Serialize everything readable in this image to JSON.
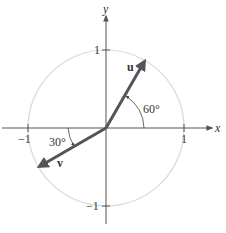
{
  "diagram": {
    "type": "unit-circle-vectors",
    "axes": {
      "x_label": "x",
      "y_label": "y",
      "x_ticks": [
        {
          "value": -1,
          "label": "−1"
        },
        {
          "value": 1,
          "label": "1"
        }
      ],
      "y_ticks": [
        {
          "value": 1,
          "label": "1"
        },
        {
          "value": -1,
          "label": "−1"
        }
      ]
    },
    "circle": {
      "radius": 1,
      "color": "#d9d9d9"
    },
    "vectors": [
      {
        "name": "u",
        "label": "u",
        "angle_deg": 60,
        "length": 1,
        "color": "#555555"
      },
      {
        "name": "v",
        "label": "v",
        "angle_deg": 210,
        "length": 1,
        "color": "#555555"
      }
    ],
    "angle_annotations": [
      {
        "label": "60°",
        "from_deg": 0,
        "to_deg": 60,
        "describes": "u measured from positive x-axis"
      },
      {
        "label": "30°",
        "from_deg": 180,
        "to_deg": 210,
        "describes": "v measured from negative x-axis"
      }
    ],
    "colors": {
      "axis": "#555555",
      "vector": "#555555",
      "circle": "#d9d9d9",
      "text": "#333333"
    }
  }
}
